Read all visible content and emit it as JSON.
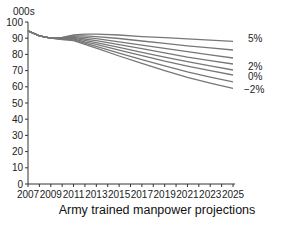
{
  "chart_data": {
    "type": "line",
    "title": "Army trained manpower projections",
    "xlabel": "",
    "ylabel": "000s",
    "xlim": [
      2007,
      2025
    ],
    "ylim": [
      0,
      100
    ],
    "x_ticks": [
      2007,
      2009,
      2011,
      2013,
      2015,
      2017,
      2019,
      2021,
      2023,
      2025
    ],
    "y_ticks": [
      0,
      10,
      20,
      30,
      40,
      50,
      60,
      70,
      80,
      90,
      100
    ],
    "grid": false,
    "legend": "inline labels at right end of lines",
    "x": [
      2007,
      2008,
      2009,
      2010,
      2011,
      2012,
      2013,
      2015,
      2017,
      2019,
      2021,
      2023,
      2025
    ],
    "series": [
      {
        "name": "5%",
        "values": [
          94.5,
          91.5,
          90.0,
          90.5,
          92.0,
          92.5,
          92.5,
          92.0,
          91.0,
          90.3,
          89.6,
          88.8,
          88.0
        ]
      },
      {
        "name": "",
        "values": [
          94.5,
          91.5,
          90.0,
          90.3,
          91.5,
          91.5,
          91.0,
          89.8,
          88.3,
          86.8,
          85.3,
          84.0,
          82.7
        ]
      },
      {
        "name": "",
        "values": [
          94.5,
          91.5,
          90.0,
          90.1,
          91.0,
          90.5,
          89.7,
          87.8,
          85.7,
          83.7,
          81.7,
          79.7,
          77.8
        ]
      },
      {
        "name": "2%",
        "values": [
          94.5,
          91.5,
          90.0,
          90.0,
          90.5,
          89.5,
          88.5,
          86.0,
          83.5,
          80.9,
          78.3,
          76.2,
          74.1
        ]
      },
      {
        "name": "",
        "values": [
          94.5,
          91.5,
          90.0,
          89.8,
          90.0,
          88.7,
          87.3,
          84.3,
          81.3,
          78.3,
          75.5,
          72.9,
          70.4
        ]
      },
      {
        "name": "0%",
        "values": [
          94.5,
          91.5,
          90.0,
          89.6,
          89.5,
          87.8,
          86.2,
          82.6,
          79.2,
          75.8,
          72.8,
          70.0,
          67.3
        ]
      },
      {
        "name": "",
        "values": [
          94.5,
          91.5,
          90.0,
          89.4,
          89.0,
          87.0,
          85.0,
          80.8,
          76.8,
          72.9,
          69.2,
          66.0,
          63.0
        ]
      },
      {
        "name": "-2%",
        "values": [
          94.5,
          91.5,
          90.0,
          89.2,
          88.5,
          86.2,
          83.8,
          79.0,
          74.5,
          70.0,
          65.8,
          62.3,
          59.0
        ]
      }
    ]
  },
  "labels": {
    "unit": "000s",
    "title": "Army trained manpower projections",
    "series_labels": [
      "5%",
      "2%",
      "0%",
      "−2%"
    ]
  }
}
